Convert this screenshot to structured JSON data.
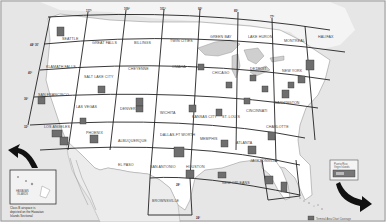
{
  "map": {
    "title": "Sectional Aeronautical Charts Index",
    "colors": {
      "ocean": "#e4e4e4",
      "land": "#ffffff",
      "grid_line": "#333333",
      "tac_box": "#6e6e6e",
      "water": "#cfcfcf"
    },
    "sectionals": [
      {
        "name": "SEATTLE"
      },
      {
        "name": "GREAT FALLS"
      },
      {
        "name": "BILLINGS"
      },
      {
        "name": "TWIN CITIES"
      },
      {
        "name": "GREEN BAY"
      },
      {
        "name": "LAKE HURON"
      },
      {
        "name": "MONTREAL"
      },
      {
        "name": "HALIFAX"
      },
      {
        "name": "KLAMATH FALLS"
      },
      {
        "name": "SALT LAKE CITY"
      },
      {
        "name": "CHEYENNE"
      },
      {
        "name": "OMAHA"
      },
      {
        "name": "CHICAGO"
      },
      {
        "name": "DETROIT"
      },
      {
        "name": "NEW YORK"
      },
      {
        "name": "SAN FRANCISCO"
      },
      {
        "name": "LAS VEGAS"
      },
      {
        "name": "DENVER"
      },
      {
        "name": "WICHITA"
      },
      {
        "name": "KANSAS CITY"
      },
      {
        "name": "ST. LOUIS"
      },
      {
        "name": "CINCINNATI"
      },
      {
        "name": "WASHINGTON"
      },
      {
        "name": "LOS ANGELES"
      },
      {
        "name": "PHOENIX"
      },
      {
        "name": "ALBUQUERQUE"
      },
      {
        "name": "DALLAS-FT WORTH"
      },
      {
        "name": "MEMPHIS"
      },
      {
        "name": "ATLANTA"
      },
      {
        "name": "CHARLOTTE"
      },
      {
        "name": "EL PASO"
      },
      {
        "name": "SAN ANTONIO"
      },
      {
        "name": "HOUSTON"
      },
      {
        "name": "NEW ORLEANS"
      },
      {
        "name": "JACKSONVILLE"
      },
      {
        "name": "BROWNSVILLE"
      },
      {
        "name": "MIAMI"
      }
    ],
    "terminal_areas": [
      {
        "name": "Seattle"
      },
      {
        "name": "Minneapolis-St. Paul"
      },
      {
        "name": "Chicago"
      },
      {
        "name": "Detroit"
      },
      {
        "name": "Boston"
      },
      {
        "name": "New York"
      },
      {
        "name": "Philadelphia"
      },
      {
        "name": "Baltimore-Washington"
      },
      {
        "name": "San Francisco"
      },
      {
        "name": "Salt Lake City"
      },
      {
        "name": "Denver"
      },
      {
        "name": "Colorado Springs"
      },
      {
        "name": "Kansas City"
      },
      {
        "name": "St. Louis"
      },
      {
        "name": "Cincinnati"
      },
      {
        "name": "Cleveland"
      },
      {
        "name": "Las Vegas"
      },
      {
        "name": "Los Angeles"
      },
      {
        "name": "San Diego"
      },
      {
        "name": "Phoenix"
      },
      {
        "name": "Dallas-Ft Worth"
      },
      {
        "name": "Memphis"
      },
      {
        "name": "Atlanta"
      },
      {
        "name": "Charlotte"
      },
      {
        "name": "Houston"
      },
      {
        "name": "New Orleans"
      },
      {
        "name": "Tampa-Orlando"
      },
      {
        "name": "Miami"
      }
    ],
    "degrees": {
      "lon_125": "125°",
      "lon_117": "117°",
      "lon_109": "109°",
      "lon_101": "101°",
      "lon_93": "93°",
      "lon_85": "85°",
      "lon_77": "77°",
      "lon_69": "69°",
      "lat_44": "44° 30'",
      "lat_40": "40°",
      "lat_36": "36°",
      "lat_32": "32°",
      "lat_28": "28°",
      "lat_24": "24°"
    },
    "hawaii": {
      "label_line1": "HAWAIIAN",
      "label_line2": "ISLANDS",
      "note_line1": "Class B airspace is",
      "note_line2": "depicted on the Hawaiian",
      "note_line3": "Islands Sectional"
    },
    "legend": {
      "title_line1": "Puerto Rico",
      "title_line2": "Virgin Islands",
      "inner_label": "TAC"
    },
    "footer_note": "Terminal Area Chart Coverage"
  }
}
